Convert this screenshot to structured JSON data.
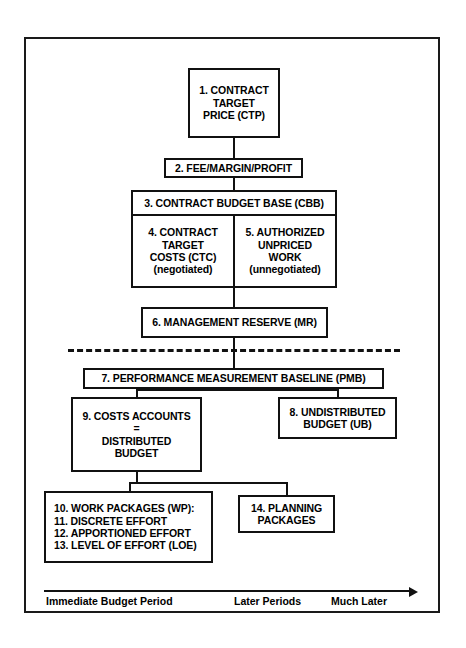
{
  "diagram": {
    "boxes": [
      {
        "id": "box-1-contract-target-price",
        "lines": [
          "1. CONTRACT",
          "TARGET",
          "PRICE (CTP)"
        ],
        "font_size": 10.5
      },
      {
        "id": "box-2-fee-margin-profit",
        "lines": [
          "2. FEE/MARGIN/PROFIT"
        ],
        "font_size": 10.5
      },
      {
        "id": "box-3-contract-budget-base",
        "lines": [
          "3. CONTRACT BUDGET BASE (CBB)"
        ],
        "font_size": 10.5
      },
      {
        "id": "box-4-contract-target-costs",
        "lines": [
          "4. CONTRACT",
          "TARGET",
          "COSTS (CTC)",
          "(negotiated)"
        ],
        "font_size": 10.5
      },
      {
        "id": "box-5-authorized-unpriced-work",
        "lines": [
          "5. AUTHORIZED",
          "UNPRICED",
          "WORK",
          "(unnegotiated)"
        ],
        "font_size": 10.5
      },
      {
        "id": "box-6-management-reserve",
        "lines": [
          "6. MANAGEMENT RESERVE (MR)"
        ],
        "font_size": 10.5
      },
      {
        "id": "box-7-performance-measurement-baseline",
        "lines": [
          "7. PERFORMANCE MEASUREMENT BASELINE (PMB)"
        ],
        "font_size": 10.5
      },
      {
        "id": "box-8-undistributed-budget",
        "lines": [
          "8. UNDISTRIBUTED",
          "BUDGET (UB)"
        ],
        "font_size": 10.5
      },
      {
        "id": "box-9-costs-accounts",
        "lines": [
          "9. COSTS ACCOUNTS",
          "=",
          "DISTRIBUTED",
          "BUDGET"
        ],
        "font_size": 10.5
      },
      {
        "id": "box-10-work-packages",
        "lines": [
          "10. WORK PACKAGES (WP):",
          "11. DISCRETE EFFORT",
          "12. APPORTIONED EFFORT",
          "13. LEVEL OF EFFORT (LOE)"
        ],
        "font_size": 10.5
      },
      {
        "id": "box-14-planning-packages",
        "lines": [
          "14. PLANNING",
          "PACKAGES"
        ],
        "font_size": 10.5
      }
    ],
    "timeline": {
      "labels": [
        "Immediate Budget Period",
        "Later Periods",
        "Much Later"
      ]
    },
    "colors": {
      "line": "#111111",
      "frame": "#1a1a1a",
      "background": "#ffffff",
      "text": "#000000"
    }
  }
}
